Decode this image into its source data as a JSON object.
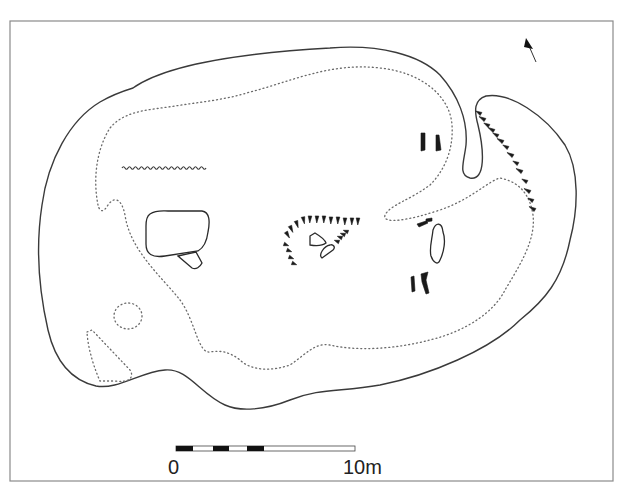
{
  "figure": {
    "type": "archaeological site plan",
    "frame": {
      "x": 10,
      "y": 21,
      "width": 603,
      "height": 460,
      "stroke": "#8a8a8a"
    }
  },
  "north_arrow": {
    "icon": "north-arrow-icon",
    "tip": [
      527,
      40
    ],
    "tail": [
      536,
      62
    ]
  },
  "scale_bar": {
    "start_label": "0",
    "end_label": "10m",
    "x": 176,
    "y": 446,
    "width": 179,
    "height": 5,
    "segments": [
      {
        "fill": "#111111",
        "from": 0,
        "to": 17
      },
      {
        "fill": "#ffffff",
        "from": 17,
        "to": 37
      },
      {
        "fill": "#111111",
        "from": 37,
        "to": 53
      },
      {
        "fill": "#ffffff",
        "from": 53,
        "to": 71
      },
      {
        "fill": "#111111",
        "from": 71,
        "to": 88
      },
      {
        "fill": "#ffffff",
        "from": 88,
        "to": 179
      }
    ]
  },
  "legend_colors": {
    "line": "#3a3a3a",
    "dotted": "#6a6a6a",
    "solid": "#1a1a1a"
  },
  "features": {
    "outer_outline": "M 133 88 C 170 62, 260 52, 330 48 C 380 44, 420 55, 440 75 C 458 95, 468 120, 466 145 C 464 162, 458 175, 470 178 C 486 181, 484 150, 478 125 C 474 110, 474 100, 486 96 C 510 92, 545 115, 565 145 C 580 170, 578 210, 570 240 C 562 280, 545 300, 520 320 C 490 350, 430 375, 380 385 C 340 392, 320 388, 290 400 C 265 410, 240 412, 225 405 C 200 394, 188 368, 165 370 C 140 372, 118 390, 96 386 C 70 380, 55 360, 48 330 C 40 295, 35 250, 42 205 C 48 160, 70 120, 100 102 C 112 95, 120 92, 133 88 Z",
    "inner_dotted": "M 98 205 C 93 180, 96 150, 110 128 C 125 110, 150 110, 175 106 C 200 102, 225 100, 250 92 C 290 82, 330 62, 380 68 C 420 72, 450 95, 452 125 C 454 155, 440 175, 430 185 C 410 200, 390 205, 385 215 C 382 225, 410 220, 440 210 C 470 200, 490 180, 500 178 C 520 182, 530 195, 533 215 C 536 240, 520 265, 505 290 C 495 310, 470 330, 430 340 C 400 348, 360 352, 330 345 C 315 342, 305 355, 290 365 C 270 372, 250 370, 240 360 C 230 352, 220 350, 210 352 C 198 354, 195 320, 180 300 C 160 275, 130 250, 125 215 C 122 200, 115 195, 108 205 C 104 212, 100 213, 98 205 Z",
    "dotted_circle": {
      "cx": 128,
      "cy": 316,
      "rx": 14,
      "ry": 13
    },
    "dotted_triangle": "M 87 332 L 92 330 L 130 370 C 135 378, 128 383, 115 381 L 100 381 C 95 370, 88 350, 87 332 Z",
    "wavy_line": {
      "x1": 122,
      "x2": 204,
      "y": 168
    },
    "structure_box": "M 150 214 C 156 210, 162 211, 168 211 L 202 211 C 210 212, 210 222, 208 232 C 207 240, 205 247, 198 251 L 165 256 C 152 258, 146 254, 146 244 L 146 226 C 146 220, 147 216, 150 214 Z",
    "structure_annex": "M 178 256 L 196 252 L 202 263 C 200 267, 196 270, 192 268 Z",
    "enclosure_triangle": "M 310 236 L 315 233 C 320 236, 325 240, 326 243 C 322 246, 316 246, 310 245 Z",
    "enclosure_oval": "M 322 258 C 318 255, 324 246, 330 245 C 333 244, 336 247, 333 250 Z",
    "boulder": "M 433 230 C 436 222, 442 222, 443 232 C 446 240, 444 252, 440 260 C 438 266, 433 262, 431 256 C 429 248, 432 240, 433 230 Z",
    "hook_loop": "M 478 125 C 472 108, 472 98, 484 96"
  },
  "hachures": {
    "right_bank": [
      [
        481,
        114
      ],
      [
        485,
        120
      ],
      [
        489,
        126
      ],
      [
        494,
        131
      ],
      [
        498,
        136
      ],
      [
        503,
        142
      ],
      [
        508,
        148
      ],
      [
        513,
        156
      ],
      [
        518,
        164
      ],
      [
        522,
        172
      ],
      [
        527,
        182
      ],
      [
        530,
        192
      ],
      [
        533,
        201
      ],
      [
        535,
        210
      ]
    ],
    "enclosure_arc": [
      [
        286,
        232
      ],
      [
        290,
        226
      ],
      [
        296,
        221
      ],
      [
        303,
        217
      ],
      [
        310,
        216
      ],
      [
        317,
        216
      ],
      [
        324,
        216
      ],
      [
        331,
        217
      ],
      [
        338,
        217
      ],
      [
        345,
        218
      ],
      [
        352,
        218
      ],
      [
        358,
        218
      ]
    ],
    "enclosure_lower": [
      [
        284,
        244
      ],
      [
        287,
        250
      ],
      [
        289,
        257
      ],
      [
        292,
        263
      ],
      [
        339,
        242
      ],
      [
        342,
        238
      ],
      [
        345,
        235
      ],
      [
        348,
        232
      ]
    ]
  },
  "solid_stones": [
    {
      "name": "stone-1",
      "d": "M 421 133 L 425 133 L 425 150 L 421 151 Z"
    },
    {
      "name": "stone-2",
      "d": "M 436 135 L 439 135 L 441 150 L 436 151 Z"
    },
    {
      "name": "stone-3",
      "d": "M 417 224 L 426 221 L 428 223 L 419 227 Z"
    },
    {
      "name": "stone-4",
      "d": "M 426 219 L 432 218 L 432 221 L 426 222 Z"
    },
    {
      "name": "stone-5",
      "d": "M 411 277 L 414 276 L 415 291 L 412 292 Z"
    },
    {
      "name": "stone-6",
      "d": "M 421 274 L 428 272 L 426 280 L 429 293 L 426 294 L 422 282 Z"
    }
  ]
}
